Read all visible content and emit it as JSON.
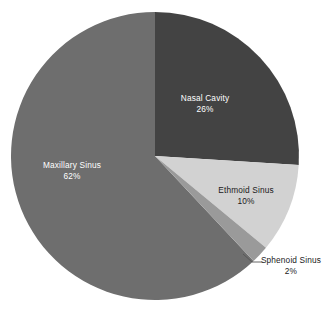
{
  "chart_data": {
    "type": "pie",
    "title": "",
    "xlabel": "",
    "ylabel": "",
    "legend": "none",
    "grid": false,
    "labels_position": "inside-slice-with-callout-for-small",
    "categories": [
      "Nasal Cavity",
      "Maxillary Sinus",
      "Ethmoid Sinus",
      "Sphenoid Sinus"
    ],
    "values": [
      26,
      62,
      10,
      2
    ],
    "value_suffix": "%",
    "start_angle_deg": 0,
    "direction": "clockwise",
    "slices": [
      {
        "label": "Nasal Cavity",
        "value": 26,
        "value_text": "26%",
        "color": "#434343",
        "label_color": "#ffffff",
        "label_placement": "inside"
      },
      {
        "label": "Ethmoid Sinus",
        "value": 10,
        "value_text": "10%",
        "color": "#d2d2d2",
        "label_color": "#1a1a1a",
        "label_placement": "inside"
      },
      {
        "label": "Sphenoid Sinus",
        "value": 2,
        "value_text": "2%",
        "color": "#9a9a9a",
        "label_color": "#1a1a1a",
        "label_placement": "outside-callout"
      },
      {
        "label": "Maxillary Sinus",
        "value": 62,
        "value_text": "62%",
        "color": "#6e6e6e",
        "label_color": "#ffffff",
        "label_placement": "inside"
      }
    ]
  },
  "colors": {
    "background": "#ffffff",
    "nasal_cavity": "#434343",
    "maxillary_sinus": "#6e6e6e",
    "ethmoid_sinus": "#d2d2d2",
    "sphenoid_sinus": "#9a9a9a",
    "callout_line": "#555555",
    "label_light": "#ffffff",
    "label_dark": "#1a1a1a"
  }
}
